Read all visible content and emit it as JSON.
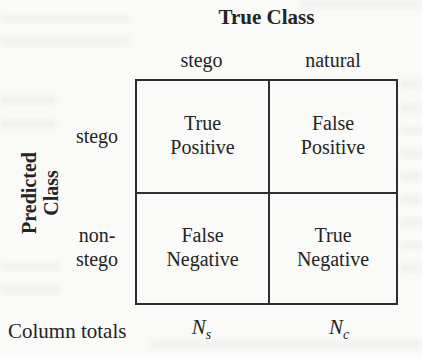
{
  "title": "True Class",
  "row_axis": {
    "line1": "Predicted",
    "line2": "Class"
  },
  "col_headers": {
    "col1": "stego",
    "col2": "natural"
  },
  "row_headers": {
    "row1": "stego",
    "row2_line1": "non-",
    "row2_line2": "stego"
  },
  "cells": {
    "tp_line1": "True",
    "tp_line2": "Positive",
    "fp_line1": "False",
    "fp_line2": "Positive",
    "fn_line1": "False",
    "fn_line2": "Negative",
    "tn_line1": "True",
    "tn_line2": "Negative"
  },
  "footer": {
    "label": "Column totals",
    "total1_symbol": "N",
    "total1_sub": "s",
    "total2_symbol": "N",
    "total2_sub": "c"
  },
  "colors": {
    "text": "#242424",
    "border": "#2e2e2e",
    "background": "#fafaf8"
  }
}
